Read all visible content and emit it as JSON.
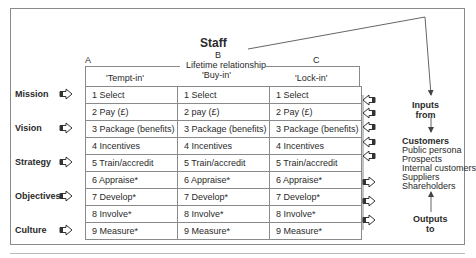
{
  "diagram": {
    "title": "Staff",
    "subtitle": "Lifetime relationship",
    "columns": [
      {
        "letter": "A",
        "label": "'Tempt-in'"
      },
      {
        "letter": "B",
        "label": "'Buy-in'"
      },
      {
        "letter": "C",
        "label": "'Lock-in'"
      }
    ],
    "row_labels": [
      "Mission",
      "Vision",
      "Strategy",
      "Objectives",
      "Culture"
    ],
    "rows": [
      [
        "1  Select",
        "1  Select",
        "1  Select"
      ],
      [
        "2  Pay (£)",
        "2  pay (£)",
        "2  Pay (£)"
      ],
      [
        "3  Package (benefits)",
        "3  Package (benefits)",
        "3  Package (benefits)"
      ],
      [
        "4  Incentives",
        "4  Incentives",
        "4  Incentives"
      ],
      [
        "5  Train/accredit",
        "5  Train/accredit",
        "5  Train/accredit"
      ],
      [
        "6  Appraise*",
        "6  Appraise*",
        "6  Appraise*"
      ],
      [
        "7  Develop*",
        "7  Develop*",
        "7  Develop*"
      ],
      [
        "8  Involve*",
        "8  Involve*",
        "8  Involve*"
      ],
      [
        "9  Measure*",
        "9  Measure*",
        "9  Measure*"
      ]
    ],
    "inputs_label": [
      "Inputs",
      "from"
    ],
    "customers": {
      "heading": "Customers",
      "items": [
        "Public persona",
        "Prospects",
        "Internal customers",
        "Suppliers",
        "Shareholders"
      ]
    },
    "outputs_label": [
      "Outputs",
      "to"
    ],
    "colors": {
      "line": "#8a8a8a",
      "text": "#2a2a2a"
    }
  }
}
